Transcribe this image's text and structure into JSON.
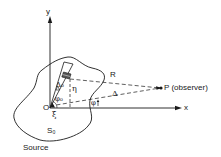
{
  "diagram": {
    "axes": {
      "y_label": "y",
      "x_label": "x",
      "origin_label": "O"
    },
    "source": {
      "region_label": "S₀",
      "caption": "Source"
    },
    "observer": {
      "label": "P (observer)"
    },
    "distances": {
      "R_label": "R",
      "delta_label": "Δ",
      "delta0_label": "Δ₀"
    },
    "coordinates": {
      "eta_label": "η",
      "xi_label": "ξ"
    },
    "angles": {
      "phi0_label": "φ₀",
      "phi_label": "φ"
    },
    "colors": {
      "ink": "#1a1a1a",
      "background": "#ffffff"
    }
  }
}
